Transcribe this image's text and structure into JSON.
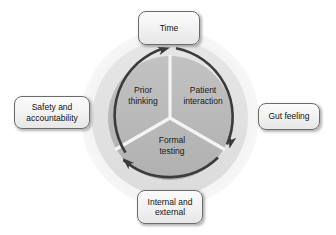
{
  "diagram": {
    "center": {
      "x": 170,
      "y": 118
    },
    "rings": [
      {
        "name": "outer-halo",
        "radius": 89,
        "color": "#f0f0f0"
      },
      {
        "name": "mid-ring",
        "radius": 78,
        "color": "#e2e2e2"
      },
      {
        "name": "inner-pie",
        "radius": 62,
        "color": "#b9b9b9"
      }
    ],
    "arc": {
      "name": "cycle-arrow-arc",
      "radius": 70,
      "color": "#3b3b3b",
      "stroke_width": 2.6,
      "direction": "clockwise"
    },
    "segments": [
      {
        "id": "patient-interaction",
        "label": "Patient\ninteraction",
        "start_angle_deg": 90,
        "end_angle_deg": 330,
        "label_x": 203,
        "label_y": 95,
        "fill": "#b9b9b9"
      },
      {
        "id": "formal-testing",
        "label": "Formal\ntesting",
        "start_angle_deg": 330,
        "end_angle_deg": 210,
        "label_x": 172,
        "label_y": 145,
        "fill": "#b4b4b4"
      },
      {
        "id": "prior-thinking",
        "label": "Prior\nthinking",
        "start_angle_deg": 210,
        "end_angle_deg": 90,
        "label_x": 143,
        "label_y": 95,
        "fill": "#bdbdbd"
      }
    ],
    "arrowheads": [
      {
        "id": "arrowhead-top",
        "x": 168,
        "y": 49,
        "rotation_deg": -20
      },
      {
        "id": "arrowhead-bottom-right",
        "x": 228,
        "y": 147,
        "rotation_deg": 100
      },
      {
        "id": "arrowhead-bottom-left",
        "x": 124,
        "y": 159,
        "rotation_deg": 220
      }
    ],
    "callouts": [
      {
        "id": "time",
        "label": "Time",
        "position": "top"
      },
      {
        "id": "safety-and-accountability",
        "label": "Safety and\naccountability",
        "position": "left"
      },
      {
        "id": "gut-feeling",
        "label": "Gut feeling",
        "position": "right"
      },
      {
        "id": "internal-and-external",
        "label": "Internal and\nexternal",
        "position": "bottom"
      }
    ]
  },
  "colors": {
    "background": "#ffffff",
    "halo": "#f0f0f0",
    "mid_ring": "#e2e2e2",
    "pie_fill": "#b9b9b9",
    "divider": "#f4f4f4",
    "arrow": "#3b3b3b",
    "box_border": "#6b6b6b",
    "text": "#141414"
  }
}
